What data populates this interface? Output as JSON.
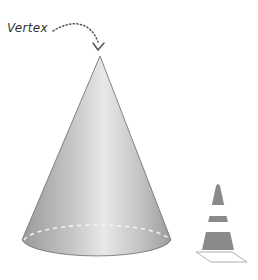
{
  "diagram": {
    "labels": {
      "vertex": "Vertex"
    },
    "colors": {
      "cone_fill_light": "#e6e6e6",
      "cone_fill_mid": "#c4c4c4",
      "cone_fill_dark": "#9a9a9a",
      "outline": "#5a5a5a",
      "dashed_base": "#f2f2f2",
      "traffic_cone": "#8a8a8a",
      "traffic_stripe": "#ffffff"
    },
    "elements": [
      "main-cone",
      "vertex-label",
      "vertex-arrow",
      "hidden-base-edge",
      "traffic-cone-example"
    ]
  }
}
